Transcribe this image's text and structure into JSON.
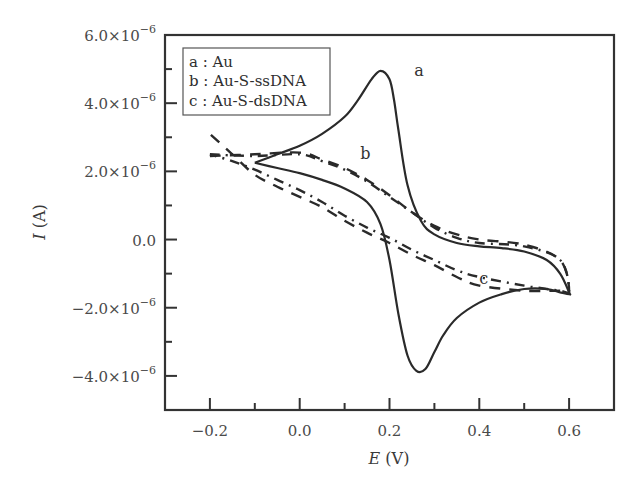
{
  "chart_data": {
    "type": "line",
    "title": "",
    "xlabel": "E (V)",
    "ylabel": "I (A)",
    "xlabel_italic": "E",
    "xlabel_unit": "(V)",
    "ylabel_italic": "I",
    "ylabel_unit": "(A)",
    "xlim": [
      -0.3,
      0.7
    ],
    "ylim": [
      -5e-06,
      6e-06
    ],
    "x_ticks": [
      -0.2,
      0.0,
      0.2,
      0.4,
      0.6
    ],
    "x_tick_labels": [
      "−0.2",
      "0.0",
      "0.2",
      "0.4",
      "0.6"
    ],
    "x_minor_ticks": [
      -0.1,
      0.1,
      0.3,
      0.5
    ],
    "y_ticks": [
      -4e-06,
      -2e-06,
      0.0,
      2e-06,
      4e-06,
      6e-06
    ],
    "y_tick_labels": [
      {
        "mantissa": "−4.0",
        "exp": "−6"
      },
      {
        "mantissa": "−2.0",
        "exp": "−6"
      },
      {
        "mantissa": "0.0",
        "exp": ""
      },
      {
        "mantissa": "2.0",
        "exp": "−6"
      },
      {
        "mantissa": "4.0",
        "exp": "−6"
      },
      {
        "mantissa": "6.0",
        "exp": "−6"
      }
    ],
    "y_minor_ticks": [
      -3e-06,
      -1e-06,
      1e-06,
      3e-06,
      5e-06
    ],
    "grid": false,
    "legend_position": "upper left",
    "legend": [
      {
        "key": "a",
        "label": "a : Au",
        "style": "solid"
      },
      {
        "key": "b",
        "label": "b : Au-S-ssDNA",
        "style": "dashed"
      },
      {
        "key": "c",
        "label": "c : Au-S-dsDNA",
        "style": "dash-dot"
      }
    ],
    "annotations": [
      {
        "text": "a",
        "x": 0.255,
        "y": 4.8e-06
      },
      {
        "text": "b",
        "x": 0.135,
        "y": 2.35e-06
      },
      {
        "text": "c",
        "x": 0.4,
        "y": -1.3e-06
      }
    ],
    "series": [
      {
        "name": "a : Au",
        "style": "solid",
        "color": "#2a2a2a",
        "x": [
          -0.1,
          -0.05,
          0.0,
          0.05,
          0.1,
          0.13,
          0.16,
          0.18,
          0.2,
          0.21,
          0.22,
          0.24,
          0.27,
          0.3,
          0.35,
          0.4,
          0.45,
          0.5,
          0.55,
          0.58,
          0.6,
          0.6,
          0.58,
          0.55,
          0.5,
          0.45,
          0.4,
          0.35,
          0.32,
          0.3,
          0.28,
          0.26,
          0.24,
          0.22,
          0.2,
          0.18,
          0.15,
          0.1,
          0.05,
          0.0,
          -0.05,
          -0.1
        ],
        "y": [
          2.25e-06,
          2.5e-06,
          2.75e-06,
          3.1e-06,
          3.6e-06,
          4.1e-06,
          4.7e-06,
          4.95e-06,
          4.7e-06,
          4.1e-06,
          3.2e-06,
          1.6e-06,
          5.5e-07,
          1.5e-07,
          -1e-07,
          -2e-07,
          -2.5e-07,
          -3.5e-07,
          -6e-07,
          -1e-06,
          -1.55e-06,
          -1.6e-06,
          -1.55e-06,
          -1.45e-06,
          -1.45e-06,
          -1.6e-06,
          -1.85e-06,
          -2.3e-06,
          -2.8e-06,
          -3.3e-06,
          -3.8e-06,
          -3.85e-06,
          -3.4e-06,
          -2.2e-06,
          -6e-07,
          4.5e-07,
          1.1e-06,
          1.5e-06,
          1.75e-06,
          1.95e-06,
          2.1e-06,
          2.25e-06
        ]
      },
      {
        "name": "b : Au-S-ssDNA",
        "style": "dashed",
        "color": "#2a2a2a",
        "x": [
          -0.2,
          -0.1,
          0.0,
          0.05,
          0.1,
          0.15,
          0.2,
          0.25,
          0.3,
          0.35,
          0.4,
          0.5,
          0.58,
          0.6,
          0.58,
          0.5,
          0.4,
          0.35,
          0.3,
          0.25,
          0.2,
          0.15,
          0.1,
          0.05,
          0.0,
          -0.05,
          -0.1,
          -0.15,
          -0.2
        ],
        "y": [
          2.45e-06,
          2.5e-06,
          2.55e-06,
          2.35e-06,
          2.1e-06,
          1.75e-06,
          1.3e-06,
          8e-07,
          4e-07,
          1.5e-07,
          0.0,
          -1.5e-07,
          -6e-07,
          -1.5e-06,
          -1.5e-06,
          -1.5e-06,
          -1.35e-06,
          -1.1e-06,
          -7.5e-07,
          -4.5e-07,
          -1e-07,
          2e-07,
          5.5e-07,
          9.5e-07,
          1.25e-06,
          1.55e-06,
          1.9e-06,
          2.5e-06,
          3.1e-06
        ]
      },
      {
        "name": "c : Au-S-dsDNA",
        "style": "dash-dot",
        "color": "#2a2a2a",
        "x": [
          -0.2,
          -0.1,
          0.0,
          0.05,
          0.1,
          0.15,
          0.2,
          0.25,
          0.3,
          0.35,
          0.4,
          0.5,
          0.58,
          0.6,
          0.58,
          0.5,
          0.4,
          0.35,
          0.3,
          0.25,
          0.2,
          0.15,
          0.1,
          0.05,
          0.0,
          -0.05,
          -0.1,
          -0.15,
          -0.2
        ],
        "y": [
          2.5e-06,
          2.45e-06,
          2.5e-06,
          2.3e-06,
          2.05e-06,
          1.7e-06,
          1.25e-06,
          8e-07,
          3.5e-07,
          5e-08,
          -1e-07,
          -2e-07,
          -6e-07,
          -1.5e-06,
          -1.5e-06,
          -1.35e-06,
          -1.1e-06,
          -9e-07,
          -6e-07,
          -3e-07,
          5e-08,
          3.5e-07,
          7e-07,
          1.1e-06,
          1.45e-06,
          1.75e-06,
          2.05e-06,
          2.3e-06,
          2.5e-06
        ]
      }
    ]
  },
  "legend": {
    "a": "a : Au",
    "b": "b : Au-S-ssDNA",
    "c": "c : Au-S-dsDNA"
  },
  "axes": {
    "x_title_italic": "E",
    "x_title_unit": " (V)",
    "y_title_italic": "I",
    "y_title_unit": " (A)"
  },
  "curve_labels": {
    "a": "a",
    "b": "b",
    "c": "c"
  }
}
